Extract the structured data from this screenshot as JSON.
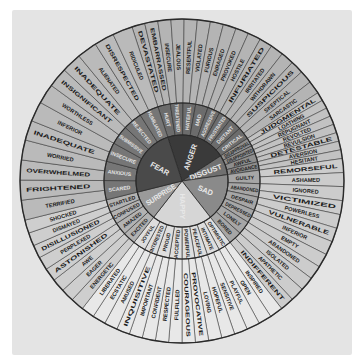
{
  "center": {
    "x": 182,
    "y": 181
  },
  "radii": {
    "core": 46,
    "middle": 78,
    "outer": 162
  },
  "colors": {
    "background": "#e4e4e4",
    "ring_line": "#2a2a2a",
    "core_text": "#e8e8e8",
    "middle_text_dark": "#e0e0e0",
    "outer_text": "#1c1c1c"
  },
  "emotions": [
    {
      "name": "ANGER",
      "start": -18,
      "end": 57,
      "core_color": "#3a3a3a",
      "mid_color": "#6c6c6c",
      "outer_color": "#b4b4b4",
      "mid_text_color": "#e2e2e2",
      "secondary": [
        {
          "label": "HURT",
          "outer": [
            "DEVASTATED",
            "EMBARRASSED"
          ]
        },
        {
          "label": "THREATENED",
          "outer": [
            "INSECURE",
            "JEALOUS"
          ]
        },
        {
          "label": "HATEFUL",
          "outer": [
            "RESENTFUL",
            "VIOLATED"
          ]
        },
        {
          "label": "MAD",
          "outer": [
            "FURIOUS",
            "ENRAGED"
          ]
        },
        {
          "label": "AGGRESSIVE",
          "outer": [
            "PROVOKED",
            "HOSTILE"
          ]
        },
        {
          "label": "FRUSTRATED",
          "outer": [
            "INFURIATED",
            "IRRITATED"
          ]
        },
        {
          "label": "DISTANT",
          "outer": [
            "WITHDRAWN",
            "SUSPICIOUS"
          ]
        },
        {
          "label": "CRITICAL",
          "outer": [
            "SKEPTICAL",
            "SARCASTIC"
          ]
        }
      ]
    },
    {
      "name": "DISGUST",
      "start": 57,
      "end": 82,
      "core_color": "#707070",
      "mid_color": "#8e8e8e",
      "outer_color": "#c2c2c2",
      "mid_text_color": "#1e1e1e",
      "secondary": [
        {
          "label": "DISAPPROVAL",
          "outer": [
            "JUDGMENTAL",
            "LOATHING"
          ]
        },
        {
          "label": "DISAPPOINTED",
          "outer": [
            "REPUGNANT",
            "REVOLTED"
          ]
        },
        {
          "label": "AWFUL",
          "outer": [
            "REVULSION",
            "DETESTABLE"
          ]
        },
        {
          "label": "AVOIDANCE",
          "outer": [
            "AVERSION",
            "HESITANT"
          ]
        }
      ]
    },
    {
      "name": "SAD",
      "start": 82,
      "end": 142,
      "core_color": "#8a8a8a",
      "mid_color": "#a6a6a6",
      "outer_color": "#cccccc",
      "mid_text_color": "#1e1e1e",
      "secondary": [
        {
          "label": "GUILTY",
          "outer": [
            "REMORSEFUL",
            "ASHAMED"
          ]
        },
        {
          "label": "ABANDONED",
          "outer": [
            "IGNORED",
            "VICTIMIZED"
          ]
        },
        {
          "label": "DESPAIR",
          "outer": [
            "POWERLESS",
            "VULNERABLE"
          ]
        },
        {
          "label": "DEPRESSED",
          "outer": [
            "INFERIOR",
            "EMPTY"
          ]
        },
        {
          "label": "LONELY",
          "outer": [
            "ABANDONED",
            "ISOLATED"
          ]
        },
        {
          "label": "BORED",
          "outer": [
            "APATHETIC",
            "INDIFFERENT"
          ]
        }
      ]
    },
    {
      "name": "HAPPY",
      "start": 142,
      "end": 218,
      "core_color": "#d6d6d6",
      "mid_color": "#dedede",
      "outer_color": "#e8e8e8",
      "mid_text_color": "#1e1e1e",
      "secondary": [
        {
          "label": "OPTIMISTIC",
          "outer": [
            "INSPIRED",
            "OPEN"
          ]
        },
        {
          "label": "INTIMATE",
          "outer": [
            "PLAYFUL",
            "SENSITIVE"
          ]
        },
        {
          "label": "PEACEFUL",
          "outer": [
            "HOPEFUL",
            "LOVING"
          ]
        },
        {
          "label": "POWERFUL",
          "outer": [
            "PROVOCATIVE",
            "COURAGEOUS"
          ]
        },
        {
          "label": "ACCEPTED",
          "outer": [
            "FULFILLED",
            "RESPECTED"
          ]
        },
        {
          "label": "PROUD",
          "outer": [
            "CONFIDENT",
            "IMPORTANT"
          ]
        },
        {
          "label": "INTERESTED",
          "outer": [
            "INQUISITIVE",
            "AMUSED"
          ]
        },
        {
          "label": "JOYFUL",
          "outer": [
            "ECSTATIC",
            "LIBERATED"
          ]
        }
      ]
    },
    {
      "name": "SURPRISE",
      "start": 218,
      "end": 256,
      "core_color": "#9a9a9a",
      "mid_color": "#b2b2b2",
      "outer_color": "#cecece",
      "mid_text_color": "#1e1e1e",
      "secondary": [
        {
          "label": "EXCITED",
          "outer": [
            "ENERGETIC",
            "EAGER"
          ]
        },
        {
          "label": "AMAZED",
          "outer": [
            "AWE",
            "ASTONISHED"
          ]
        },
        {
          "label": "CONFUSED",
          "outer": [
            "PERPLEXED",
            "DISILLUSIONED"
          ]
        },
        {
          "label": "STARTLED",
          "outer": [
            "DISMAYED",
            "SHOCKED"
          ]
        }
      ]
    },
    {
      "name": "FEAR",
      "start": 256,
      "end": 342,
      "core_color": "#4a4a4a",
      "mid_color": "#767676",
      "outer_color": "#bababa",
      "mid_text_color": "#e2e2e2",
      "secondary": [
        {
          "label": "SCARED",
          "outer": [
            "TERRIFIED",
            "FRIGHTENED"
          ]
        },
        {
          "label": "ANXIOUS",
          "outer": [
            "OVERWHELMED",
            "WORRIED"
          ]
        },
        {
          "label": "INSECURE",
          "outer": [
            "INADEQUATE",
            "INFERIOR"
          ]
        },
        {
          "label": "SUBMISSIVE",
          "outer": [
            "WORTHLESS",
            "INSIGNIFICANT"
          ]
        },
        {
          "label": "REJECTED",
          "outer": [
            "INADEQUATE",
            "ALIENATED"
          ]
        },
        {
          "label": "HUMILIATED",
          "outer": [
            "DISRESPECTED",
            "RIDICULED"
          ]
        }
      ]
    }
  ]
}
